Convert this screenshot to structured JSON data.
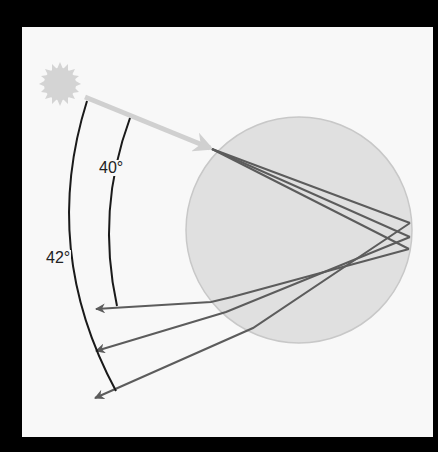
{
  "diagram": {
    "colors": {
      "frame": "#000000",
      "panel": "#f8f8f8",
      "sun": "#d4d4d4",
      "incoming_ray": "#d0d0d0",
      "raindrop_fill": "#e0e0e0",
      "raindrop_edge": "#c8c8c8",
      "light_rays": "#5c5c5c",
      "angle_arcs": "#1a1a1a"
    },
    "labels": {
      "inner_angle": "40°",
      "outer_angle": "42°"
    },
    "elements": {
      "sun": "sun-icon",
      "incoming_ray": "arrow-right-icon",
      "raindrop": "circle",
      "outgoing_rays": 3
    }
  }
}
